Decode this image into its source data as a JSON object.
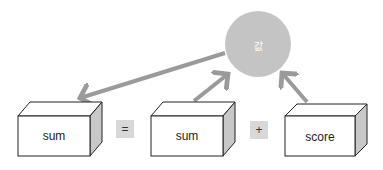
{
  "circle": {
    "label": "값",
    "color": "#c4c4c4"
  },
  "boxes": [
    {
      "label": "sum"
    },
    {
      "label": "sum"
    },
    {
      "label": "score"
    }
  ],
  "operators": {
    "equals": "=",
    "plus": "+"
  },
  "arrow_color": "#9a9a9a"
}
